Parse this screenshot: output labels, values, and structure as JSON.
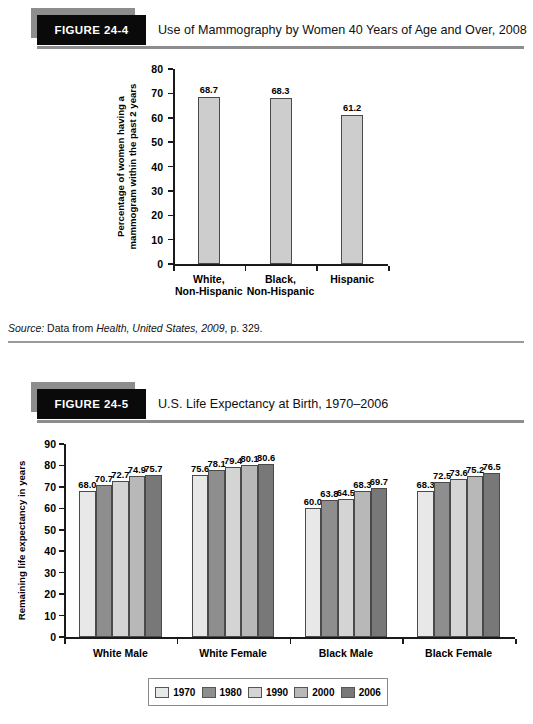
{
  "figures": [
    {
      "tag": "FIGURE 24-4",
      "title": "Use of Mammography by Women 40 Years of Age and Over, 2008"
    },
    {
      "tag": "FIGURE 24-5",
      "title": "U.S. Life Expectancy at Birth, 1970–2006"
    }
  ],
  "source": {
    "label": "Source:",
    "text_before": " Data from ",
    "italic_part": "Health, United States, 2009",
    "text_after": ", p. 329."
  },
  "legend": {
    "items": [
      {
        "label": "1970",
        "color": "#e8e8e8"
      },
      {
        "label": "1980",
        "color": "#8e8e8e"
      },
      {
        "label": "1990",
        "color": "#d4d4d4"
      },
      {
        "label": "2000",
        "color": "#b8b8b8"
      },
      {
        "label": "2006",
        "color": "#787878"
      }
    ]
  },
  "chart_data": [
    {
      "type": "bar",
      "title": "Use of Mammography by Women 40 Years of Age and Over, 2008",
      "categories": [
        "White,\nNon-Hispanic",
        "Black,\nNon-Hispanic",
        "Hispanic"
      ],
      "category_lines": [
        [
          "White,",
          "Non-Hispanic"
        ],
        [
          "Black,",
          "Non-Hispanic"
        ],
        [
          "Hispanic"
        ]
      ],
      "values": [
        68.7,
        68.3,
        61.2
      ],
      "value_labels": [
        "68.7",
        "68.3",
        "61.2"
      ],
      "xlabel": "",
      "ylabel": "Percentage of women having a mammogram within the past 2 years",
      "ylabel_lines": [
        "Percentage of women having a",
        "mammogram within the past 2 years"
      ],
      "ylim": [
        0,
        80
      ],
      "yticks": [
        0,
        10,
        20,
        30,
        40,
        50,
        60,
        70,
        80
      ],
      "grid": false,
      "bar_color": "#cdcdcd"
    },
    {
      "type": "bar",
      "title": "U.S. Life Expectancy at Birth, 1970–2006",
      "categories": [
        "White Male",
        "White Female",
        "Black Male",
        "Black Female"
      ],
      "series": [
        {
          "name": "1970",
          "color": "#e8e8e8",
          "values": [
            68.0,
            75.6,
            60.0,
            68.3
          ]
        },
        {
          "name": "1980",
          "color": "#8e8e8e",
          "values": [
            70.7,
            78.1,
            63.8,
            72.5
          ]
        },
        {
          "name": "1990",
          "color": "#d4d4d4",
          "values": [
            72.7,
            79.4,
            64.5,
            73.6
          ]
        },
        {
          "name": "2000",
          "color": "#b8b8b8",
          "values": [
            74.9,
            80.1,
            68.3,
            75.2
          ]
        },
        {
          "name": "2006",
          "color": "#787878",
          "values": [
            75.7,
            80.6,
            69.7,
            76.5
          ]
        }
      ],
      "value_labels": [
        [
          "68.0",
          "70.7",
          "72.7",
          "74.9",
          "75.7"
        ],
        [
          "75.6",
          "78.1",
          "79.4",
          "80.1",
          "80.6"
        ],
        [
          "60.0",
          "63.8",
          "64.5",
          "68.3",
          "69.7"
        ],
        [
          "68.3",
          "72.5",
          "73.6",
          "75.2",
          "76.5"
        ]
      ],
      "xlabel": "",
      "ylabel": "Remaining life expectancy in years",
      "ylim": [
        0,
        90
      ],
      "yticks": [
        0,
        10,
        20,
        30,
        40,
        50,
        60,
        70,
        80,
        90
      ],
      "grid": false,
      "legend_position": "bottom"
    }
  ]
}
